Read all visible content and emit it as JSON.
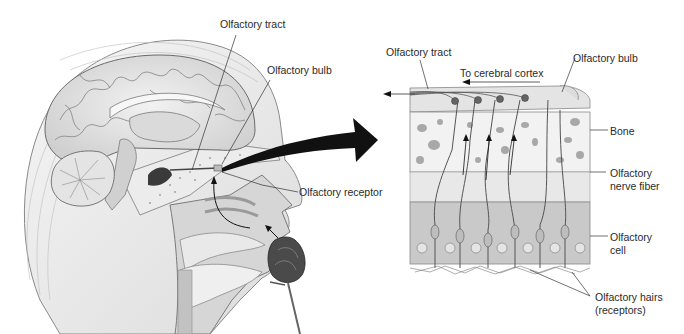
{
  "diagram": {
    "left_panel": {
      "description": "Sagittal section of human head showing brain, nasal cavity and a rose being smelled",
      "labels": {
        "tract": "Olfactory tract",
        "bulb": "Olfactory bulb",
        "receptor": "Olfactory receptor"
      }
    },
    "right_panel": {
      "description": "Enlarged view of olfactory epithelium, bone and olfactory bulb",
      "labels": {
        "tract": "Olfactory tract",
        "cortex": "To cerebral cortex",
        "bulb": "Olfactory bulb",
        "bone": "Bone",
        "nerve_fiber_1": "Olfactory",
        "nerve_fiber_2": "nerve fiber",
        "cell_1": "Olfactory",
        "cell_2": "cell",
        "hairs_1": "Olfactory hairs",
        "hairs_2": "(receptors)"
      }
    },
    "colors": {
      "line": "#333333",
      "arrow": "#111111",
      "tissue_light": "#e6e6e6",
      "tissue_mid": "#c8c8c8",
      "tissue_dark": "#9a9a9a"
    }
  }
}
